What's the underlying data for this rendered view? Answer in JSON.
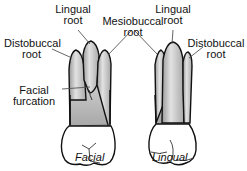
{
  "diagram": {
    "views": [
      {
        "caption": "Facial"
      },
      {
        "caption": "Lingual"
      }
    ],
    "labels": {
      "facial_lingual_root": [
        "Lingual",
        "root"
      ],
      "mesiobuccal_root": [
        "Mesiobuccal",
        "root"
      ],
      "facial_distobuccal_root": [
        "Distobuccal",
        "root"
      ],
      "facial_furcation": [
        "Facial",
        "furcation"
      ],
      "lingual_lingual_root": [
        "Lingual",
        "root"
      ],
      "lingual_distobuccal_root": [
        "Distobuccal",
        "root"
      ]
    },
    "colors": {
      "outline": "#111111",
      "root_fill": "#c8c8c8",
      "crown_fill": "#ffffff",
      "leader_line": "#555555"
    }
  }
}
